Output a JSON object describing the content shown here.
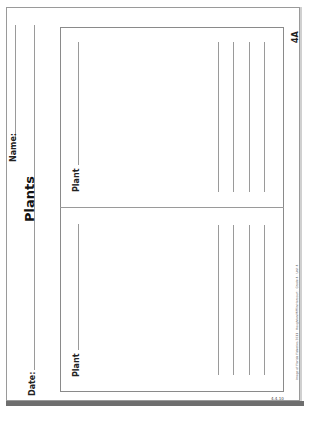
{
  "worksheet": {
    "title": "Plants",
    "id_badge": "4A",
    "date_label": "Date:",
    "name_label": "Name:",
    "orientation": "rotated 90° counter-clockwise",
    "panels": [
      {
        "label": "Plant",
        "writing_lines": 4
      },
      {
        "label": "Plant",
        "writing_lines": 4
      }
    ],
    "footer_copyright": "Image of Florida Fisheries 2011 · Houghton Mifflin Harcourt · Grade 4 · Unit 4",
    "page_number": "4.4.10"
  },
  "colors": {
    "line": "#9a9a9a",
    "border": "#8a8a8a",
    "text": "#222222",
    "shadow": "#6e6e6e"
  }
}
